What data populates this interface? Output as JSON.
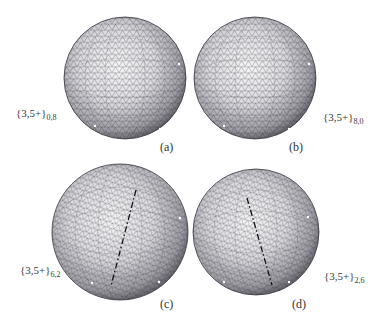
{
  "figure": {
    "panels": [
      {
        "id": "a",
        "caption": "(a)",
        "symbol": "{3,5+}",
        "subscript": "0,8",
        "cx": 125,
        "cy": 78,
        "r": 61,
        "has_dashed_line": false
      },
      {
        "id": "b",
        "caption": "(b)",
        "symbol": "{3,5+}",
        "subscript": "8,0",
        "cx": 255,
        "cy": 78,
        "r": 61,
        "has_dashed_line": false
      },
      {
        "id": "c",
        "caption": "(c)",
        "symbol": "{3,5+}",
        "subscript": "6,2",
        "cx": 120,
        "cy": 232,
        "r": 68,
        "has_dashed_line": true
      },
      {
        "id": "d",
        "caption": "(d)",
        "symbol": "{3,5+}",
        "subscript": "2,6",
        "cx": 256,
        "cy": 232,
        "r": 63,
        "has_dashed_line": true
      }
    ],
    "colors": {
      "sphere_light": "#f4f4f6",
      "sphere_mid": "#b9b8be",
      "sphere_dark": "#4a4850",
      "mesh": "#2c2c30",
      "dash": "#111111"
    }
  }
}
